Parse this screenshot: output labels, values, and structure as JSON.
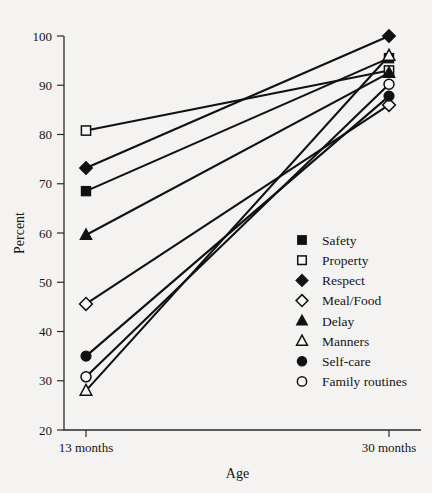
{
  "chart_data": {
    "type": "line",
    "title": "",
    "xlabel": "Age",
    "ylabel": "Percent",
    "categories": [
      "13 months",
      "30 months"
    ],
    "x": [
      13,
      30
    ],
    "xtick_labels": [
      "13 months",
      "30 months"
    ],
    "ytick_labels": [
      "20",
      "30",
      "40",
      "50",
      "60",
      "70",
      "80",
      "90",
      "100"
    ],
    "yticks": [
      20,
      30,
      40,
      50,
      60,
      70,
      80,
      90,
      100
    ],
    "ylim": [
      20,
      100
    ],
    "grid": false,
    "legend_position": "inside-lower-right",
    "series": [
      {
        "name": "Safety",
        "marker": "filled-square",
        "values": [
          68.5,
          95.5
        ]
      },
      {
        "name": "Property",
        "marker": "open-square",
        "values": [
          80.8,
          93.0
        ]
      },
      {
        "name": "Respect",
        "marker": "filled-diamond",
        "values": [
          73.2,
          100.0
        ]
      },
      {
        "name": "Meal/Food",
        "marker": "open-diamond",
        "values": [
          45.6,
          86.0
        ]
      },
      {
        "name": "Delay",
        "marker": "filled-triangle",
        "values": [
          59.6,
          92.5
        ]
      },
      {
        "name": "Manners",
        "marker": "open-triangle",
        "values": [
          28.0,
          96.0
        ]
      },
      {
        "name": "Self-care",
        "marker": "filled-circle",
        "values": [
          35.0,
          87.8
        ]
      },
      {
        "name": "Family routines",
        "marker": "open-circle",
        "values": [
          30.8,
          90.2
        ]
      }
    ],
    "legend": [
      {
        "label": "Safety",
        "marker": "filled-square"
      },
      {
        "label": "Property",
        "marker": "open-square"
      },
      {
        "label": "Respect",
        "marker": "filled-diamond"
      },
      {
        "label": "Meal/Food",
        "marker": "open-diamond"
      },
      {
        "label": "Delay",
        "marker": "filled-triangle"
      },
      {
        "label": "Manners",
        "marker": "open-triangle"
      },
      {
        "label": "Self-care",
        "marker": "filled-circle"
      },
      {
        "label": "Family routines",
        "marker": "open-circle"
      }
    ],
    "colors": {
      "ink": "#111111",
      "background": "#f4f3f1",
      "axis": "#2b2b2b"
    }
  }
}
